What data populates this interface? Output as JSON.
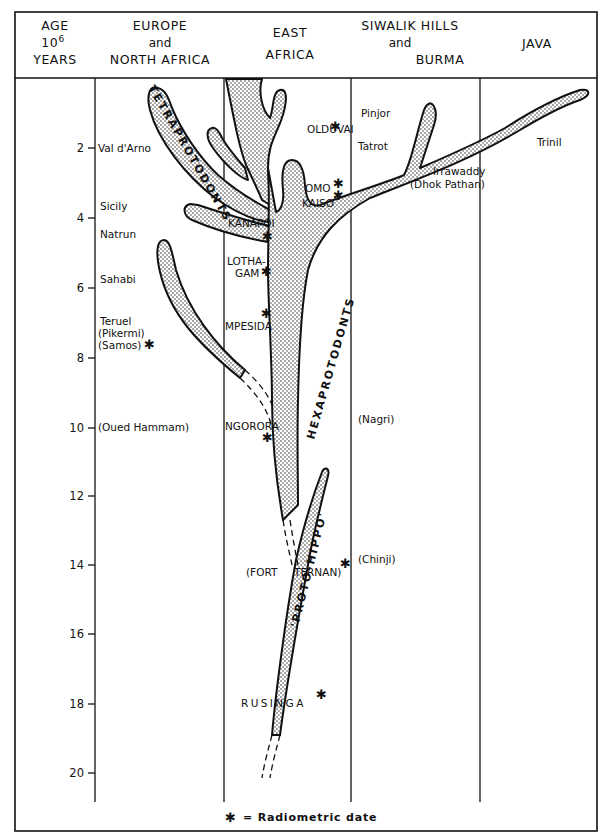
{
  "header": {
    "age_col": {
      "line1": "AGE",
      "line2": "10",
      "superscript": "6",
      "line3": "YEARS"
    },
    "columns": [
      {
        "id": "europe",
        "line1": "EUROPE",
        "line2": "and",
        "line3": "NORTH AFRICA"
      },
      {
        "id": "east_africa",
        "line1": "EAST",
        "line2": "AFRICA"
      },
      {
        "id": "siwalik",
        "line1": "SIWALIK HILLS",
        "line2": "and",
        "line3": "BURMA"
      },
      {
        "id": "java",
        "line1": "JAVA"
      }
    ]
  },
  "axis": {
    "unit": "10^6 years",
    "ticks": [
      "2",
      "4",
      "6",
      "8",
      "10",
      "12",
      "14",
      "16",
      "18",
      "20"
    ]
  },
  "clades": {
    "tetraprotodonts": "TETRAPROTODONTS",
    "hexaprotodonts": "HEXAPROTODONTS",
    "proto_hippo": "'PROTO-HIPPO'"
  },
  "localities": {
    "europe": [
      {
        "name": "Val d'Arno",
        "age": 2.0
      },
      {
        "name": "Sicily",
        "age": 3.6
      },
      {
        "name": "Natrun",
        "age": 4.5
      },
      {
        "name": "Sahabi",
        "age": 5.7
      },
      {
        "name": "Teruel",
        "age": 7.0
      },
      {
        "name": "(Pikermi)",
        "age": 7.5
      },
      {
        "name": "(Samos)",
        "age": 8.0,
        "radiometric": true
      },
      {
        "name": "(Oued Hammam)",
        "age": 10.0
      }
    ],
    "east_africa": [
      {
        "name": "OLDUVAI",
        "age": 1.4,
        "radiometric": true
      },
      {
        "name": "OMO",
        "age": 3.0,
        "radiometric": true
      },
      {
        "name": "KAISO",
        "age": 3.6,
        "radiometric": true
      },
      {
        "name": "KANAPOI",
        "age": 4.3,
        "radiometric": true
      },
      {
        "name": "LOTHA-",
        "age": 5.3
      },
      {
        "name": "GAM",
        "age": 5.7,
        "radiometric": true
      },
      {
        "name": "MPESIDA",
        "age": 7.2,
        "radiometric": true
      },
      {
        "name": "NGORORA",
        "age": 10.0,
        "radiometric": true
      },
      {
        "name": "(FORT",
        "age": 14.3
      },
      {
        "name": "TERNAN)",
        "age": 14.3,
        "radiometric": true
      },
      {
        "name": "RUSINGA",
        "age": 18.0,
        "radiometric": true
      }
    ],
    "siwalik": [
      {
        "name": "Pinjor",
        "age": 1.0
      },
      {
        "name": "Tatrot",
        "age": 2.0
      },
      {
        "name": "Irrawaddy",
        "age": 3.0
      },
      {
        "name": "(Dhok Pathan)",
        "age": 3.4
      },
      {
        "name": "(Nagri)",
        "age": 10.0
      },
      {
        "name": "(Chinji)",
        "age": 14.0
      }
    ],
    "java": [
      {
        "name": "Trinil",
        "age": 2.0
      }
    ]
  },
  "legend": {
    "symbol": "✱",
    "text": "= Radiometric date"
  },
  "colors": {
    "ink": "#111111",
    "paper": "#ffffff",
    "stipple": "#222222"
  }
}
